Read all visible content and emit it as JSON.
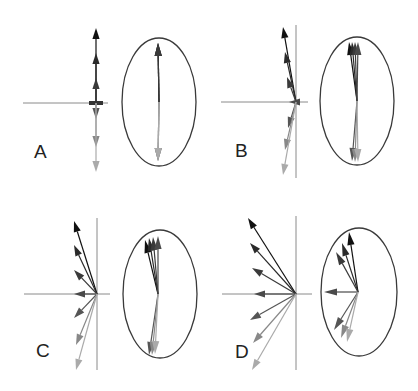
{
  "figure": {
    "width": 418,
    "height": 391,
    "colors": {
      "axis": "#8a8a8a",
      "ellipse": "#3a3a3a",
      "arrow_gradient": [
        "#111111",
        "#2a2a2a",
        "#3a3a3a",
        "#4a4a4a",
        "#555555",
        "#888888",
        "#aaaaaa"
      ]
    },
    "panels": [
      {
        "id": "A",
        "label": "A",
        "label_pos": [
          34,
          158
        ],
        "origin": [
          96,
          103
        ],
        "axes": {
          "h": [
            23,
            108
          ],
          "v": [
            20,
            180
          ]
        },
        "show_vline": false,
        "vectors": [
          [
            96,
            28
          ],
          [
            96,
            53
          ],
          [
            96,
            78
          ],
          [
            92,
            103
          ],
          [
            96,
            119
          ],
          [
            96,
            147
          ],
          [
            96,
            172
          ]
        ],
        "ellipse": {
          "cx": 159,
          "cy": 102,
          "rx": 37,
          "ry": 64
        },
        "ellipse_origin": [
          159,
          102
        ],
        "ellipse_vectors": [
          [
            158,
            43
          ],
          [
            158,
            43
          ],
          [
            158,
            43
          ],
          [
            158,
            161
          ],
          [
            158,
            161
          ],
          [
            158,
            161
          ]
        ]
      },
      {
        "id": "B",
        "label": "B",
        "label_pos": [
          235,
          157
        ],
        "origin": [
          296,
          102
        ],
        "axes": {
          "h": [
            221,
            308
          ],
          "v": [
            25,
            178
          ]
        },
        "show_vline": true,
        "vectors": [
          [
            283,
            27
          ],
          [
            285,
            52
          ],
          [
            287,
            77
          ],
          [
            289,
            102
          ],
          [
            288,
            128
          ],
          [
            285,
            150
          ],
          [
            283,
            175
          ]
        ],
        "ellipse": {
          "cx": 357,
          "cy": 101,
          "rx": 37,
          "ry": 64
        },
        "ellipse_origin": [
          357,
          101
        ],
        "ellipse_vectors": [
          [
            349,
            42
          ],
          [
            352,
            42
          ],
          [
            355,
            42
          ],
          [
            358,
            42
          ],
          [
            352,
            161
          ],
          [
            355,
            162
          ],
          [
            358,
            162
          ]
        ]
      },
      {
        "id": "C",
        "label": "C",
        "label_pos": [
          36,
          357
        ],
        "origin": [
          97,
          294
        ],
        "axes": {
          "h": [
            24,
            110
          ],
          "v": [
            218,
            370
          ]
        },
        "show_vline": true,
        "vectors": [
          [
            74,
            221
          ],
          [
            74,
            245
          ],
          [
            74,
            270
          ],
          [
            74,
            294
          ],
          [
            74,
            318
          ],
          [
            76,
            345
          ],
          [
            76,
            370
          ]
        ],
        "ellipse": {
          "cx": 160,
          "cy": 294,
          "rx": 37,
          "ry": 64
        },
        "ellipse_origin": [
          158,
          294
        ],
        "ellipse_vectors": [
          [
            145,
            240
          ],
          [
            149,
            238
          ],
          [
            153,
            237
          ],
          [
            158,
            236
          ],
          [
            149,
            355
          ],
          [
            152,
            355
          ],
          [
            155,
            354
          ]
        ]
      },
      {
        "id": "D",
        "label": "D",
        "label_pos": [
          235,
          358
        ],
        "origin": [
          296,
          294
        ],
        "axes": {
          "h": [
            222,
            312
          ],
          "v": [
            216,
            370
          ]
        },
        "show_vline": true,
        "vectors": [
          [
            248,
            218
          ],
          [
            250,
            243
          ],
          [
            252,
            268
          ],
          [
            254,
            294
          ],
          [
            250,
            320
          ],
          [
            253,
            343
          ],
          [
            252,
            370
          ]
        ],
        "ellipse": {
          "cx": 359,
          "cy": 292,
          "rx": 38,
          "ry": 64
        },
        "ellipse_origin": [
          358,
          292
        ],
        "ellipse_vectors": [
          [
            349,
            232
          ],
          [
            342,
            243
          ],
          [
            336,
            252
          ],
          [
            324,
            292
          ],
          [
            334,
            330
          ],
          [
            341,
            338
          ],
          [
            347,
            342
          ]
        ]
      }
    ]
  }
}
